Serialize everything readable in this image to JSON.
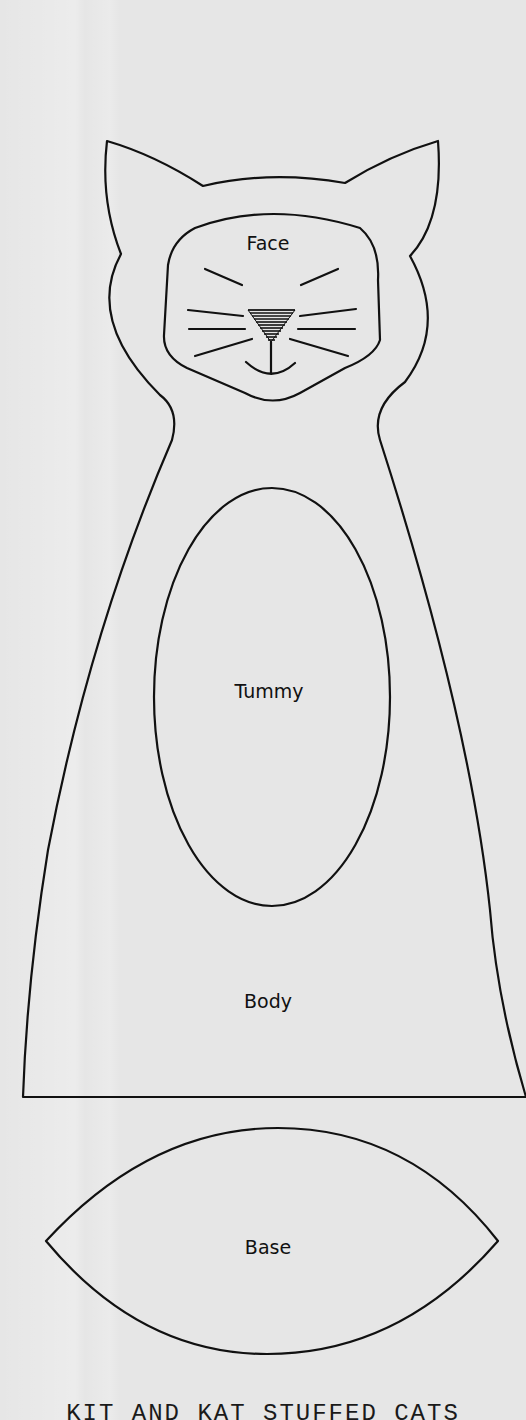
{
  "document": {
    "type": "sewing-pattern",
    "title": "KIT AND KAT STUFFED CATS",
    "background_color": "#e6e6e6",
    "line_color": "#111111"
  },
  "pieces": {
    "face": {
      "label": "Face"
    },
    "tummy": {
      "label": "Tummy"
    },
    "body": {
      "label": "Body"
    },
    "base": {
      "label": "Base"
    }
  },
  "face_details": {
    "eyes": "closed-eye-lines",
    "nose": "hatched-triangle",
    "whiskers_per_side": 3,
    "mouth": "smile"
  }
}
